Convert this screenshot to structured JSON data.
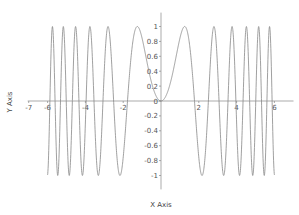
{
  "chart_data": {
    "type": "line",
    "title": "",
    "xlabel": "X Axis",
    "ylabel": "Y Axis",
    "function": "sin(x^2)",
    "x_range": [
      -6,
      6
    ],
    "xlim": [
      -7,
      6.8
    ],
    "ylim": [
      -1.2,
      1.2
    ],
    "x_ticks": [
      -7,
      -6,
      -4,
      -2,
      0,
      2,
      4,
      6
    ],
    "x_tick_labels": [
      "-7",
      "-6",
      "-4",
      "-2",
      "0",
      "2",
      "4",
      "6"
    ],
    "y_ticks": [
      -1,
      -0.8,
      -0.6,
      -0.4,
      -0.2,
      0,
      0.2,
      0.4,
      0.6,
      0.8,
      1
    ],
    "y_tick_labels": [
      "-1",
      "-0.8",
      "-0.6",
      "-0.4",
      "-0.2",
      "0",
      "0.2",
      "0.4",
      "0.6",
      "0.8",
      "1"
    ],
    "grid": false,
    "legend": null,
    "series": [
      {
        "name": "sin(x^2)",
        "color": "#888888",
        "sample_points": {
          "x": [
            -6,
            -5,
            -4,
            -3,
            -2,
            -1.2533,
            -1,
            0,
            1,
            1.2533,
            2,
            3,
            4,
            5,
            6
          ],
          "y": [
            -0.99,
            -0.13,
            -0.29,
            0.41,
            -0.76,
            1,
            0.84,
            0,
            0.84,
            1,
            -0.76,
            0.41,
            -0.29,
            -0.13,
            -0.99
          ]
        }
      }
    ]
  },
  "colors": {
    "axis": "#888888",
    "curve": "#888888",
    "text": "#555555"
  },
  "labels": {
    "x_axis_title": "X Axis",
    "y_axis_title": "Y Axis"
  }
}
